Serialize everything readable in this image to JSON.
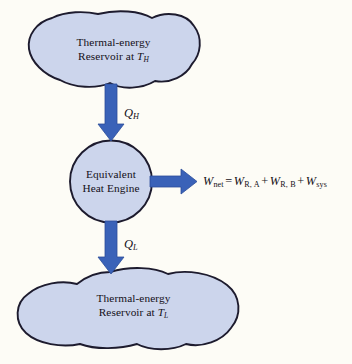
{
  "figure": {
    "type": "thermodynamics-block-diagram",
    "background_color": "#fdfcf6"
  },
  "colors": {
    "shape_fill": "#ccd5ec",
    "shape_stroke": "#1d1b2e",
    "arrow_fill": "#3a62b8",
    "arrow_stroke": "#2b4d99",
    "text": "#141018"
  },
  "nodes": {
    "hot_reservoir": {
      "name": "hot-thermal-energy-reservoir",
      "shape": "cloud-blob",
      "line1": "Thermal-energy",
      "line2_prefix": "Reservoir at ",
      "line2_symbol": "T",
      "line2_subscript": "H"
    },
    "engine": {
      "name": "equivalent-heat-engine",
      "shape": "circle",
      "line1": "Equivalent",
      "line2": "Heat Engine"
    },
    "cold_reservoir": {
      "name": "cold-thermal-energy-reservoir",
      "shape": "cloud-blob",
      "line1": "Thermal-energy",
      "line2_prefix": "Reservoir at ",
      "line2_symbol": "T",
      "line2_subscript": "L"
    }
  },
  "flows": {
    "heat_in": {
      "name": "heat-input-arrow",
      "direction": "down",
      "symbol": "Q",
      "subscript": "H"
    },
    "heat_out": {
      "name": "heat-output-arrow",
      "direction": "down",
      "symbol": "Q",
      "subscript": "L"
    },
    "work_out": {
      "name": "net-work-output-arrow",
      "direction": "right",
      "equation": {
        "lhs_symbol": "W",
        "lhs_subscript": "net",
        "equals": "=",
        "terms": [
          {
            "symbol": "W",
            "subscript": "R, A"
          },
          {
            "symbol": "W",
            "subscript": "R, B"
          },
          {
            "symbol": "W",
            "subscript": "sys"
          }
        ],
        "operator": "+",
        "plain_text": "W_net = W_R, A + W_R, B + W_sys"
      }
    }
  }
}
